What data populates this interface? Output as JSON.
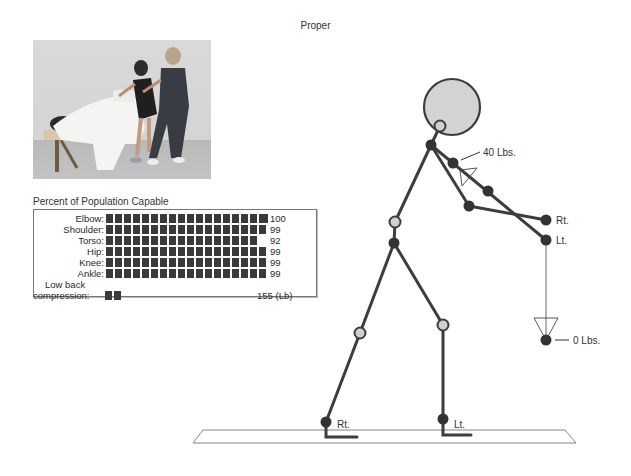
{
  "title": "Proper",
  "photo": {
    "description": "massage-table-posture-photo"
  },
  "population_panel": {
    "title": "Percent of Population Capable",
    "rows": [
      {
        "label": "Elbow:",
        "blocks": 18,
        "tick": true,
        "value": "100"
      },
      {
        "label": "Shoulder:",
        "blocks": 18,
        "tick": false,
        "value": "99"
      },
      {
        "label": "Torso:",
        "blocks": 17,
        "tick": false,
        "value": "92"
      },
      {
        "label": "Hip:",
        "blocks": 18,
        "tick": false,
        "value": "99"
      },
      {
        "label": "Knee:",
        "blocks": 18,
        "tick": false,
        "value": "99"
      },
      {
        "label": "Ankle:",
        "blocks": 18,
        "tick": false,
        "value": "99"
      }
    ],
    "low_back": {
      "label_line1": "Low back",
      "label_line2": "compression:",
      "blocks": 2,
      "value": "155 (Lb)"
    }
  },
  "figure": {
    "hand_force_label": "40 Lbs.",
    "hand_right_label": "Rt.",
    "hand_left_label": "Lt.",
    "weight_label": "0 Lbs.",
    "foot_right_label": "Rt.",
    "foot_left_label": "Lt.",
    "colors": {
      "limb": "#3d3d3d",
      "joint_dark": "#333333",
      "joint_light": "#d0d0d0",
      "head_fill": "#d3d3d3"
    }
  }
}
